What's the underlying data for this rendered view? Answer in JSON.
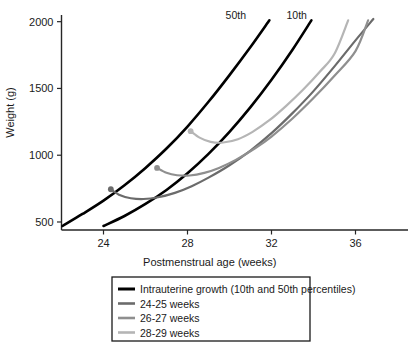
{
  "chart_data": {
    "type": "line",
    "title": "",
    "xlabel": "Postmenstrual age (weeks)",
    "ylabel": "Weight (g)",
    "xlim": [
      22.0,
      38.5
    ],
    "ylim": [
      440,
      2050
    ],
    "xticks": [
      24,
      28,
      32,
      36
    ],
    "xtick_labels": [
      "24",
      "28",
      "32",
      "36"
    ],
    "yticks": [
      500,
      1000,
      1500,
      2000
    ],
    "ytick_labels": [
      "500",
      "1000",
      "1500",
      "2000"
    ],
    "grid": false,
    "legend_position": "below-plot",
    "annotations": [
      {
        "text": "50th",
        "x": 30.3,
        "y": 2020,
        "name": "curve-label-50th"
      },
      {
        "text": "10th",
        "x": 33.2,
        "y": 2020,
        "name": "curve-label-10th"
      }
    ],
    "series": [
      {
        "name": "Intrauterine growth 50th percentile",
        "legend_key": "intrauterine",
        "color": "#000000",
        "width": 2.6,
        "start_marker": false,
        "points": [
          [
            22.05,
            470
          ],
          [
            23.0,
            560
          ],
          [
            24.0,
            660
          ],
          [
            25.0,
            775
          ],
          [
            26.0,
            905
          ],
          [
            27.0,
            1050
          ],
          [
            28.0,
            1215
          ],
          [
            29.0,
            1400
          ],
          [
            30.0,
            1600
          ],
          [
            31.0,
            1810
          ],
          [
            31.9,
            2010
          ]
        ]
      },
      {
        "name": "Intrauterine growth 10th percentile",
        "legend_key": "intrauterine",
        "color": "#000000",
        "width": 2.6,
        "start_marker": false,
        "points": [
          [
            24.0,
            470
          ],
          [
            25.0,
            545
          ],
          [
            26.0,
            635
          ],
          [
            27.0,
            740
          ],
          [
            28.0,
            865
          ],
          [
            29.0,
            1010
          ],
          [
            30.0,
            1175
          ],
          [
            31.0,
            1360
          ],
          [
            32.0,
            1565
          ],
          [
            33.0,
            1790
          ],
          [
            33.9,
            2010
          ]
        ]
      },
      {
        "name": "24-25 weeks",
        "legend_key": "w24_25",
        "color": "#6b6b6b",
        "width": 2.2,
        "start_marker": true,
        "marker": [
          24.35,
          745
        ],
        "points": [
          [
            24.35,
            745
          ],
          [
            24.8,
            700
          ],
          [
            25.3,
            678
          ],
          [
            25.9,
            672
          ],
          [
            26.6,
            685
          ],
          [
            27.4,
            718
          ],
          [
            28.2,
            768
          ],
          [
            29.0,
            832
          ],
          [
            30.0,
            925
          ],
          [
            31.0,
            1035
          ],
          [
            32.0,
            1165
          ],
          [
            33.0,
            1315
          ],
          [
            34.0,
            1480
          ],
          [
            35.0,
            1665
          ],
          [
            36.0,
            1860
          ],
          [
            36.85,
            2020
          ]
        ]
      },
      {
        "name": "26-27 weeks",
        "legend_key": "w26_27",
        "color": "#8f8f8f",
        "width": 2.2,
        "start_marker": true,
        "marker": [
          26.55,
          905
        ],
        "points": [
          [
            26.55,
            905
          ],
          [
            27.0,
            868
          ],
          [
            27.5,
            850
          ],
          [
            28.1,
            848
          ],
          [
            28.8,
            868
          ],
          [
            29.5,
            905
          ],
          [
            30.3,
            965
          ],
          [
            31.2,
            1050
          ],
          [
            32.0,
            1140
          ],
          [
            33.0,
            1275
          ],
          [
            34.0,
            1428
          ],
          [
            35.0,
            1595
          ],
          [
            36.0,
            1780
          ],
          [
            36.6,
            2010
          ]
        ]
      },
      {
        "name": "28-29 weeks",
        "legend_key": "w28_29",
        "color": "#b5b5b5",
        "width": 2.2,
        "start_marker": true,
        "marker": [
          28.15,
          1180
        ],
        "points": [
          [
            28.15,
            1180
          ],
          [
            28.6,
            1130
          ],
          [
            29.1,
            1100
          ],
          [
            29.7,
            1095
          ],
          [
            30.4,
            1120
          ],
          [
            31.1,
            1175
          ],
          [
            31.9,
            1262
          ],
          [
            32.7,
            1370
          ],
          [
            33.5,
            1490
          ],
          [
            34.3,
            1625
          ],
          [
            35.0,
            1760
          ],
          [
            35.65,
            2010
          ]
        ]
      }
    ]
  },
  "legend": {
    "entries": [
      {
        "label": "Intrauterine growth (10th and 50th percentiles)",
        "color": "#000000",
        "width": 3.0
      },
      {
        "label": "24-25 weeks",
        "color": "#6b6b6b",
        "width": 2.6
      },
      {
        "label": "26-27 weeks",
        "color": "#8f8f8f",
        "width": 2.6
      },
      {
        "label": "28-29 weeks",
        "color": "#b5b5b5",
        "width": 2.6
      }
    ]
  },
  "axes": {
    "x_title": "Postmenstrual age (weeks)",
    "y_title": "Weight (g)"
  }
}
